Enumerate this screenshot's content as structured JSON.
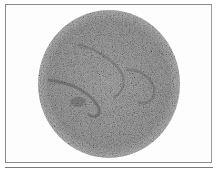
{
  "figure": {
    "colors": {
      "background": "#ffffff",
      "frame_border": "#8a8a8a",
      "disc_base": "#9c9c9c",
      "disc_dark": "#5a5a5a",
      "disc_light": "#d8d8d8",
      "rule": "#7a7a7a"
    },
    "disc": {
      "cx": 109,
      "cy": 84,
      "rx": 71,
      "ry": 74
    }
  }
}
